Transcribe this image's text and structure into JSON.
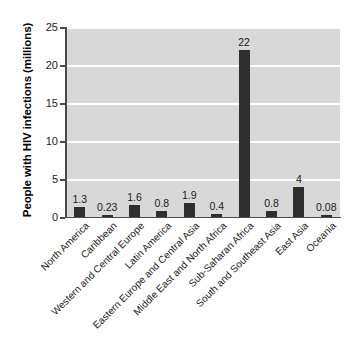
{
  "chart_data": {
    "type": "bar",
    "title": "",
    "subtitle": "",
    "xlabel": "",
    "ylabel": "People with HIV infections (millions)",
    "categories": [
      "North America",
      "Caribbean",
      "Western and Central Europe",
      "Latin America",
      "Eastern Europe and Central Asia",
      "Middle East and North Africa",
      "Sub-Saharan Africa",
      "South and Southeast Asia",
      "East Asia",
      "Oceania"
    ],
    "values": [
      1.3,
      0.23,
      1.6,
      0.8,
      1.9,
      0.4,
      22,
      0.8,
      4,
      0.08
    ],
    "value_labels": [
      "1.3",
      "0.23",
      "1.6",
      "0.8",
      "1.9",
      "0.4",
      "22",
      "0.8",
      "4",
      "0.08"
    ],
    "ylim": [
      0,
      25
    ],
    "yticks": [
      0,
      5,
      10,
      15,
      20,
      25
    ],
    "ytick_labels": [
      "0",
      "5",
      "10",
      "15",
      "20",
      "25"
    ],
    "grid": true,
    "grid_axis": "y",
    "legend": false,
    "legend_position": "none",
    "colors": {
      "bar": "#2f2f2f",
      "plot_background": "#d8d8d8",
      "gridline": "#ffffff",
      "axis": "#4a4a4a",
      "text": "#1a1a1a",
      "figure_background": "#ffffff"
    }
  }
}
